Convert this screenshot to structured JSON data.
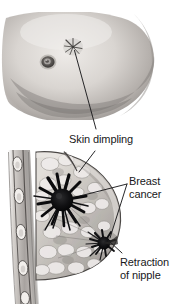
{
  "figure": {
    "background_color": "#ffffff",
    "width": 179,
    "height": 304,
    "style": "grayscale medical illustration"
  },
  "panels": [
    {
      "id": "photo-panel",
      "name": "external-breast-photograph",
      "description": "Grayscale photograph of an external breast showing skin dimpling and the areola",
      "region": {
        "x": 0,
        "y": 0,
        "width": 179,
        "height": 130
      },
      "features": [
        {
          "name": "nipple-areola",
          "x": 48,
          "y": 62
        },
        {
          "name": "skin-dimple-star",
          "x": 73,
          "y": 47
        }
      ]
    },
    {
      "id": "cross-section-panel",
      "name": "breast-cross-section",
      "description": "Sagittal cross-section of the breast against the chest wall showing ribs, fatty lobular tissue, a spiculated tumor and a second tumor retracting the nipple",
      "region": {
        "x": 0,
        "y": 148,
        "width": 179,
        "height": 156
      },
      "features": [
        {
          "name": "chest-wall-ribs",
          "x": 18,
          "y": 225
        },
        {
          "name": "primary-spiculated-tumor",
          "x": 62,
          "y": 200
        },
        {
          "name": "nipple-retraction-tumor",
          "x": 104,
          "y": 243
        },
        {
          "name": "skin-dimple-indentation",
          "x": 72,
          "y": 170
        }
      ]
    }
  ],
  "labels": [
    {
      "id": "skin-dimpling",
      "text": "Skin dimpling",
      "lines": [
        "Skin dimpling"
      ],
      "x": 69,
      "y": 133,
      "color": "#18181a"
    },
    {
      "id": "breast-cancer",
      "text": "Breast cancer",
      "lines": [
        "Breast",
        "cancer"
      ],
      "x": 129,
      "y": 175,
      "color": "#18181a"
    },
    {
      "id": "retraction-of-nipple",
      "text": "Retraction of nipple",
      "lines": [
        "Retraction",
        "of nipple"
      ],
      "x": 120,
      "y": 256,
      "color": "#18181a"
    }
  ],
  "leader_lines": [
    {
      "id": "leader-skin-dimpling-photo",
      "from_label": "skin-dimpling",
      "to_feature": "skin-dimple-star",
      "path": "M 96 130 L 74 50"
    },
    {
      "id": "leader-skin-dimpling-section",
      "from_label": "skin-dimpling",
      "to_feature": "skin-dimple-indentation",
      "path": "M 96 150 L 79 172"
    },
    {
      "id": "leader-breast-cancer-primary",
      "from_label": "breast-cancer",
      "to_feature": "primary-spiculated-tumor",
      "path": "M 127 185 L 80 196"
    },
    {
      "id": "leader-breast-cancer-secondary",
      "from_label": "breast-cancer",
      "to_feature": "nipple-retraction-tumor",
      "path": "M 127 185 L 110 238"
    },
    {
      "id": "leader-retraction",
      "from_label": "retraction-of-nipple",
      "to_feature": "nipple-retraction-tumor",
      "path": "M 122 253 L 108 240"
    }
  ],
  "colors": {
    "background": "#ffffff",
    "text": "#18181a",
    "leader_line": "#1b1b1d",
    "tumor_dark": "#0d0d0f",
    "skin_light": "#e6e3e0",
    "skin_mid": "#c9c5c2",
    "skin_shadow": "#8e8a88",
    "tissue_light": "#ded9d5",
    "tissue_mid": "#b0aba7",
    "tissue_dark": "#6e6a67",
    "rib_fill": "#efece9",
    "muscle_gray": "#9a9694"
  }
}
